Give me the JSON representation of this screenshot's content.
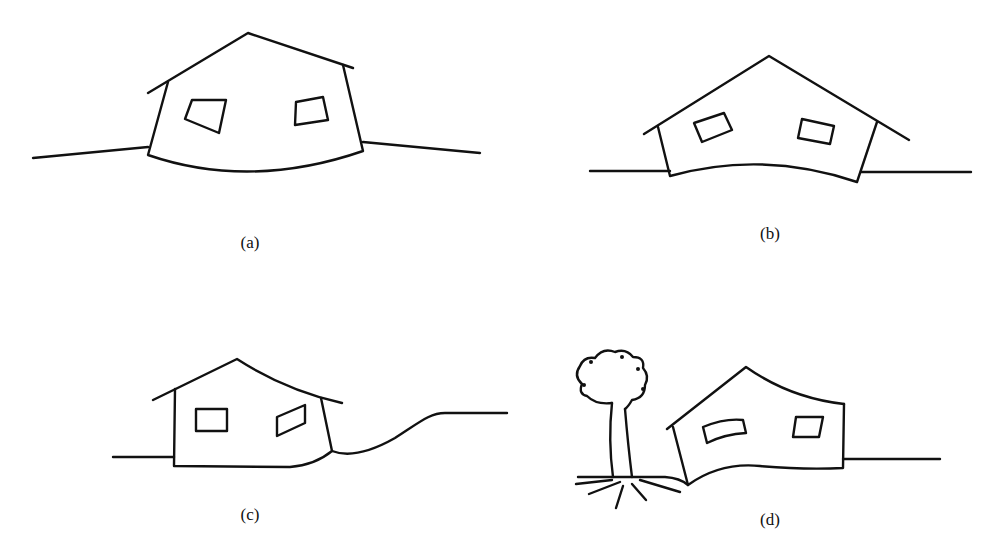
{
  "figure": {
    "panels": [
      {
        "id": "a",
        "label": "(a)",
        "subject": "house sagging into depressed ground, curved concave floor"
      },
      {
        "id": "b",
        "label": "(b)",
        "subject": "house hogging over raised ground, convex floor"
      },
      {
        "id": "c",
        "label": "(c)",
        "subject": "house near slope, one corner settling"
      },
      {
        "id": "d",
        "label": "(d)",
        "subject": "house tilted near tree with roots"
      }
    ]
  }
}
